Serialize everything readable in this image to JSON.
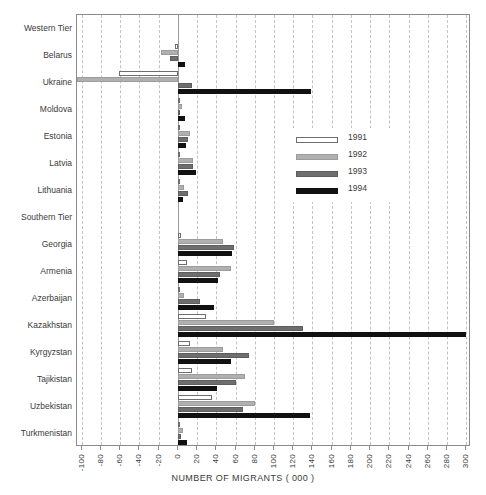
{
  "chart_data": {
    "type": "bar",
    "orientation": "horizontal",
    "title": "",
    "xlabel": "NUMBER OF MIGRANTS ( 000 )",
    "ylabel": "",
    "xlim": [
      -105,
      305
    ],
    "xticks": [
      -100,
      -80,
      -60,
      -40,
      -20,
      0,
      20,
      40,
      60,
      80,
      100,
      120,
      140,
      160,
      180,
      200,
      220,
      240,
      260,
      280,
      300
    ],
    "grid": true,
    "legend_position": "center-right",
    "categories": [
      "Western Tier",
      "Belarus",
      "Ukraine",
      "Moldova",
      "Estonia",
      "Latvia",
      "Lithuania",
      "Southern Tier",
      "Georgia",
      "Armenia",
      "Azerbaijan",
      "Kazakhstan",
      "Kyrgyzstan",
      "Tajikistan",
      "Uzbekistan",
      "Turkmenistan"
    ],
    "group_headers": [
      "Western Tier",
      "Southern Tier"
    ],
    "series": [
      {
        "name": "1991",
        "color": "#ffffff",
        "values": {
          "Belarus": -3,
          "Ukraine": -61,
          "Moldova": 1,
          "Estonia": 1,
          "Latvia": 1,
          "Lithuania": 1,
          "Georgia": 3,
          "Armenia": 9,
          "Azerbaijan": 2,
          "Kazakhstan": 29,
          "Kyrgyzstan": 13,
          "Tajikistan": 15,
          "Uzbekistan": 35,
          "Turkmenistan": 2
        }
      },
      {
        "name": "1992",
        "color": "#b0b0b0",
        "values": {
          "Belarus": -18,
          "Ukraine": -125,
          "Moldova": 4,
          "Estonia": 13,
          "Latvia": 16,
          "Lithuania": 6,
          "Georgia": 47,
          "Armenia": 55,
          "Azerbaijan": 6,
          "Kazakhstan": 100,
          "Kyrgyzstan": 47,
          "Tajikistan": 70,
          "Uzbekistan": 80,
          "Turkmenistan": 5
        }
      },
      {
        "name": "1993",
        "color": "#6e6e6e",
        "values": {
          "Belarus": -8,
          "Ukraine": 15,
          "Moldova": 2,
          "Estonia": 11,
          "Latvia": 16,
          "Lithuania": 11,
          "Georgia": 58,
          "Armenia": 44,
          "Azerbaijan": 23,
          "Kazakhstan": 130,
          "Kyrgyzstan": 74,
          "Tajikistan": 60,
          "Uzbekistan": 68,
          "Turkmenistan": 3
        }
      },
      {
        "name": "1994",
        "color": "#111111",
        "values": {
          "Belarus": 7,
          "Ukraine": 138,
          "Moldova": 7,
          "Estonia": 8,
          "Latvia": 19,
          "Lithuania": 5,
          "Georgia": 56,
          "Armenia": 42,
          "Azerbaijan": 38,
          "Kazakhstan": 300,
          "Kyrgyzstan": 55,
          "Tajikistan": 41,
          "Uzbekistan": 137,
          "Turkmenistan": 9
        }
      }
    ]
  },
  "legend": {
    "entries": [
      {
        "label": "1991",
        "swatch": "y1991"
      },
      {
        "label": "1992",
        "swatch": "y1992"
      },
      {
        "label": "1993",
        "swatch": "y1993"
      },
      {
        "label": "1994",
        "swatch": "y1994"
      }
    ]
  },
  "axis": {
    "x_title": "NUMBER OF MIGRANTS ( 000 )"
  }
}
